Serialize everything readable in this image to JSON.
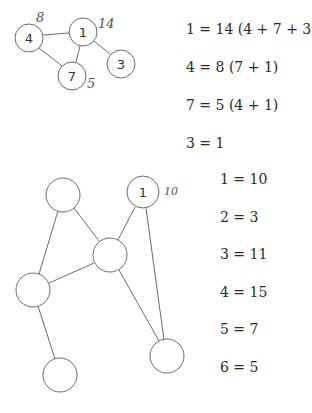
{
  "top_graph": {
    "nodes": [
      {
        "id": "4",
        "label": "4",
        "x": 29,
        "y": 38,
        "annotation": "8"
      },
      {
        "id": "1",
        "label": "1",
        "x": 83,
        "y": 32,
        "annotation": "14"
      },
      {
        "id": "3",
        "label": "3",
        "x": 121,
        "y": 64,
        "annotation": ""
      },
      {
        "id": "7",
        "label": "7",
        "x": 72,
        "y": 76,
        "annotation": "5"
      }
    ],
    "edges": [
      [
        "4",
        "1"
      ],
      [
        "4",
        "7"
      ],
      [
        "1",
        "7"
      ],
      [
        "1",
        "3"
      ]
    ]
  },
  "top_equations": [
    "1 = 14 (4 + 7 + 3)",
    "4 = 8 (7 + 1)",
    "7 = 5 (4 + 1)",
    "3 = 1"
  ],
  "bottom_graph": {
    "nodes": [
      {
        "id": "a",
        "label": "",
        "x": 63,
        "y": 195
      },
      {
        "id": "b",
        "label": "1",
        "x": 143,
        "y": 192,
        "annotation": "10"
      },
      {
        "id": "c",
        "label": "",
        "x": 110,
        "y": 255
      },
      {
        "id": "d",
        "label": "",
        "x": 33,
        "y": 290
      },
      {
        "id": "e",
        "label": "",
        "x": 60,
        "y": 375
      },
      {
        "id": "f",
        "label": "",
        "x": 167,
        "y": 356
      }
    ],
    "edges": [
      [
        "a",
        "c"
      ],
      [
        "a",
        "d"
      ],
      [
        "b",
        "c"
      ],
      [
        "b",
        "f"
      ],
      [
        "c",
        "d"
      ],
      [
        "c",
        "f"
      ],
      [
        "d",
        "e"
      ]
    ]
  },
  "bottom_equations": [
    "1 = 10",
    "2 = 3",
    "3 = 11",
    "4 = 15",
    "5 = 7",
    "6 = 5"
  ]
}
